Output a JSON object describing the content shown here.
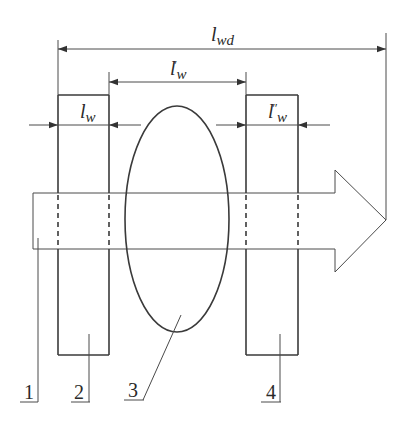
{
  "diagram": {
    "dimensions": {
      "total": {
        "base": "l",
        "sub": "wd",
        "prime": ""
      },
      "gap": {
        "base": "l",
        "sub": "w",
        "prime": "′"
      },
      "left_width": {
        "base": "l",
        "sub": "w",
        "prime": ""
      },
      "right_width": {
        "base": "l",
        "sub": "w",
        "prime": "″"
      }
    },
    "callouts": [
      {
        "id": "1",
        "label": "1"
      },
      {
        "id": "2",
        "label": "2"
      },
      {
        "id": "3",
        "label": "3"
      },
      {
        "id": "4",
        "label": "4"
      }
    ],
    "colors": {
      "stroke": "#3a3a3a",
      "background": "#ffffff"
    }
  }
}
